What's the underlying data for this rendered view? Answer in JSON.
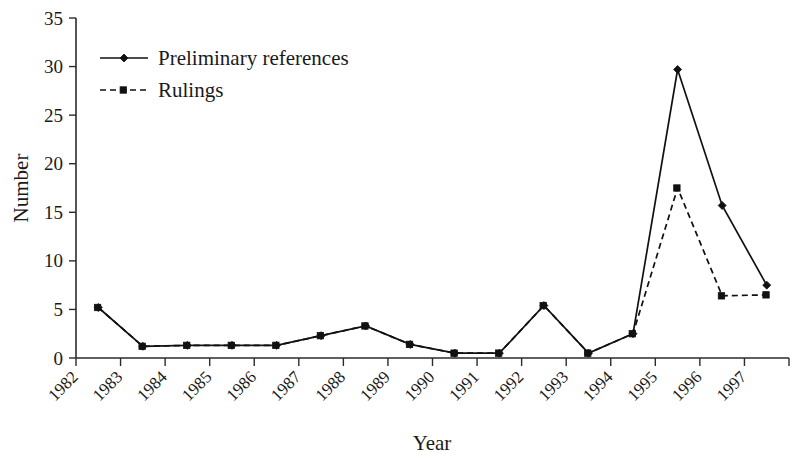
{
  "chart_data": {
    "type": "line",
    "title": "",
    "xlabel": "Year",
    "ylabel": "Number",
    "ylim": [
      0,
      35
    ],
    "yticks": [
      0,
      5,
      10,
      15,
      20,
      25,
      30,
      35
    ],
    "ytick_labels": [
      "0",
      "5",
      "10",
      "15",
      "20",
      "25",
      "30",
      "35"
    ],
    "grid": false,
    "legend_position": "top-left",
    "categories": [
      "1982",
      "1983",
      "1984",
      "1985",
      "1986",
      "1987",
      "1988",
      "1989",
      "1990",
      "1991",
      "1992",
      "1993",
      "1994",
      "1995",
      "1996",
      "1997"
    ],
    "series": [
      {
        "name": "Preliminary references",
        "marker": "diamond",
        "linestyle": "solid",
        "color": "#111111",
        "values": [
          5.2,
          1.2,
          1.3,
          1.3,
          1.3,
          2.3,
          3.3,
          1.4,
          0.5,
          0.5,
          5.4,
          0.5,
          2.5,
          29.7,
          15.7,
          7.5
        ]
      },
      {
        "name": "Rulings",
        "marker": "square",
        "linestyle": "dashed",
        "color": "#111111",
        "values": [
          5.2,
          1.2,
          1.3,
          1.3,
          1.3,
          2.3,
          3.3,
          1.4,
          0.5,
          0.5,
          5.4,
          0.5,
          2.5,
          17.5,
          6.4,
          6.5
        ]
      }
    ]
  },
  "legend": {
    "items": [
      {
        "label": "Preliminary references",
        "marker": "diamond",
        "linestyle": "solid"
      },
      {
        "label": "Rulings",
        "marker": "square",
        "linestyle": "dashed"
      }
    ]
  },
  "axes": {
    "y_title": "Number",
    "x_title": "Year"
  }
}
